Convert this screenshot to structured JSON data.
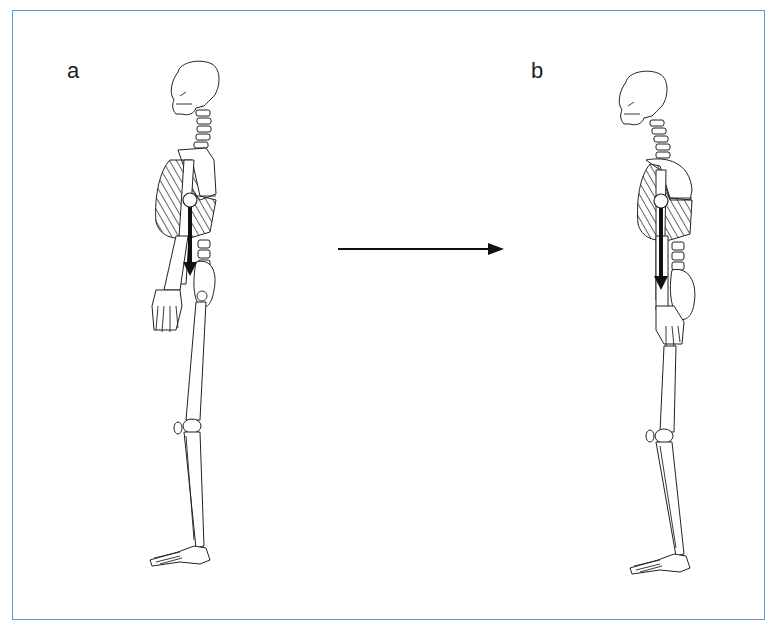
{
  "figure": {
    "panels": [
      {
        "label": "a",
        "description": "skeleton upright posture, center-of-mass gravity line arrow from thorax"
      },
      {
        "label": "b",
        "description": "skeleton with forward-shifted posture, gravity line arrow from thorax"
      }
    ],
    "transition_arrow": {
      "direction": "right",
      "meaning": "change from a to b"
    },
    "colors": {
      "border": "#5b9bd5",
      "ink": "#222222",
      "background": "#ffffff"
    }
  }
}
